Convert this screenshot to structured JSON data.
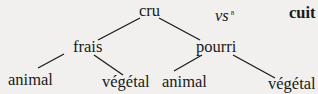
{
  "tree": {
    "root": "cru",
    "contrast": {
      "marker": "vs",
      "note": "8",
      "term": "cuit"
    },
    "branches": [
      {
        "label": "frais",
        "leaves": [
          "animal",
          "végétal"
        ]
      },
      {
        "label": "pourri",
        "leaves": [
          "animal",
          "végétal"
        ]
      }
    ]
  },
  "colors": {
    "background": "#f1f0ee",
    "ink": "#1a1a1a"
  }
}
